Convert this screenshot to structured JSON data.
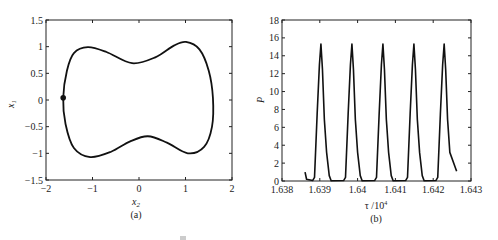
{
  "figure": {
    "caption_partial": "图 ..."
  },
  "chart_data": [
    {
      "type": "line",
      "panel": "(a)",
      "title": "",
      "xlabel": "x2",
      "xlabel_main": "x",
      "xlabel_sub": "2",
      "ylabel": "x1",
      "ylabel_main": "x",
      "ylabel_sub": "1",
      "xlim": [
        -2,
        2
      ],
      "ylim": [
        -1.5,
        1.5
      ],
      "xticks": [
        -2,
        -1,
        0,
        1,
        2
      ],
      "xtick_labels": [
        "−2",
        "−1",
        "0",
        "1",
        "2"
      ],
      "yticks": [
        1.5,
        1,
        0.5,
        0,
        -0.5,
        -1,
        -1.5
      ],
      "ytick_labels": [
        "1.5",
        "1",
        "0.5",
        "0",
        "−0.5",
        "−1",
        "−1.5"
      ],
      "grid": false,
      "description": "closed phase-plane limit cycle",
      "series": [
        {
          "name": "limit cycle",
          "closed": true,
          "x": [
            -1.63,
            -1.55,
            -1.4,
            -1.1,
            -0.7,
            -0.15,
            0.35,
            0.75,
            1.01,
            1.3,
            1.5,
            1.59,
            1.57,
            1.4,
            1.05,
            0.6,
            0.19,
            -0.2,
            -0.6,
            -1.05,
            -1.4,
            -1.58,
            -1.63
          ],
          "y": [
            0.04,
            0.55,
            0.88,
            0.99,
            0.9,
            0.69,
            0.8,
            1.02,
            1.09,
            0.95,
            0.55,
            0.04,
            -0.5,
            -0.88,
            -1.0,
            -0.8,
            -0.68,
            -0.78,
            -0.97,
            -1.07,
            -0.9,
            -0.45,
            0.04
          ]
        }
      ],
      "markers": [
        {
          "x": -1.63,
          "y": 0.04,
          "style": "filled-dot"
        }
      ]
    },
    {
      "type": "line",
      "panel": "(b)",
      "title": "",
      "xlabel": "τ /10^4",
      "xlabel_main": "τ /10",
      "xlabel_sup": "4",
      "ylabel": "P",
      "xlim": [
        1.638,
        1.643
      ],
      "ylim": [
        0,
        18
      ],
      "xticks": [
        1.638,
        1.639,
        1.64,
        1.641,
        1.642,
        1.643
      ],
      "xtick_labels": [
        "1.638",
        "1.639",
        "1.64",
        "1.641",
        "1.642",
        "1.643"
      ],
      "yticks": [
        0,
        2,
        4,
        6,
        8,
        10,
        12,
        14,
        16,
        18
      ],
      "ytick_labels": [
        "0",
        "2",
        "4",
        "6",
        "8",
        "10",
        "12",
        "14",
        "16",
        "18"
      ],
      "grid": false,
      "description": "periodic pulses, 5 peaks of P≈15.3 with a shoulder at P≈6.3 on the falling edge",
      "peaks": [
        {
          "tau": 1.63903,
          "P": 15.3
        },
        {
          "tau": 1.63985,
          "P": 15.3
        },
        {
          "tau": 1.64067,
          "P": 15.3
        },
        {
          "tau": 1.64149,
          "P": 15.3
        },
        {
          "tau": 1.64229,
          "P": 15.3
        }
      ],
      "period": 0.00082,
      "start": {
        "tau": 1.63861,
        "P": 1.0
      },
      "end": {
        "tau": 1.64262,
        "P": 1.1
      },
      "shoulder_P": 6.3
    }
  ]
}
